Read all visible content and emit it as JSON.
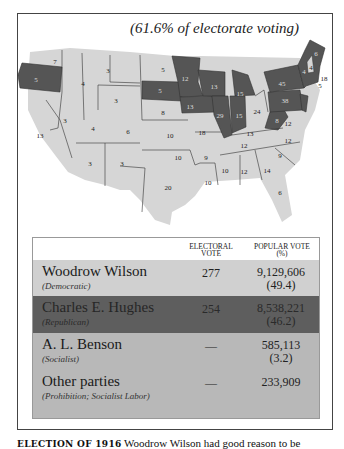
{
  "figure": {
    "subtitle": "(61.6% of electorate voting)",
    "colors": {
      "democratic": "#d6d6d6",
      "republican": "#555555",
      "state_border": "#333333",
      "table_header": "#ffffff",
      "wilson_row": "#d0d0d0",
      "hughes_row": "#5e5e5e",
      "other_rows": "#b8b8b8"
    }
  },
  "map": {
    "states": [
      {
        "abbr": "WA",
        "ev": "7",
        "party": "D"
      },
      {
        "abbr": "OR",
        "ev": "5",
        "party": "R"
      },
      {
        "abbr": "CA",
        "ev": "13",
        "party": "D"
      },
      {
        "abbr": "ID",
        "ev": "4",
        "party": "D"
      },
      {
        "abbr": "NV",
        "ev": "3",
        "party": "D"
      },
      {
        "abbr": "MT",
        "ev": "4",
        "party": "D"
      },
      {
        "abbr": "WY",
        "ev": "3",
        "party": "D"
      },
      {
        "abbr": "UT",
        "ev": "4",
        "party": "D"
      },
      {
        "abbr": "CO",
        "ev": "6",
        "party": "D"
      },
      {
        "abbr": "AZ",
        "ev": "3",
        "party": "D"
      },
      {
        "abbr": "NM",
        "ev": "3",
        "party": "D"
      },
      {
        "abbr": "ND",
        "ev": "5",
        "party": "D"
      },
      {
        "abbr": "SD",
        "ev": "5",
        "party": "R"
      },
      {
        "abbr": "NE",
        "ev": "8",
        "party": "D"
      },
      {
        "abbr": "KS",
        "ev": "10",
        "party": "D"
      },
      {
        "abbr": "OK",
        "ev": "10",
        "party": "D"
      },
      {
        "abbr": "TX",
        "ev": "20",
        "party": "D"
      },
      {
        "abbr": "MN",
        "ev": "12",
        "party": "R"
      },
      {
        "abbr": "IA",
        "ev": "13",
        "party": "R"
      },
      {
        "abbr": "MO",
        "ev": "18",
        "party": "D"
      },
      {
        "abbr": "AR",
        "ev": "9",
        "party": "D"
      },
      {
        "abbr": "LA",
        "ev": "10",
        "party": "D"
      },
      {
        "abbr": "WI",
        "ev": "13",
        "party": "R"
      },
      {
        "abbr": "IL",
        "ev": "29",
        "party": "R"
      },
      {
        "abbr": "MI",
        "ev": "15",
        "party": "R"
      },
      {
        "abbr": "IN",
        "ev": "15",
        "party": "R"
      },
      {
        "abbr": "OH",
        "ev": "24",
        "party": "D"
      },
      {
        "abbr": "KY",
        "ev": "13",
        "party": "D"
      },
      {
        "abbr": "TN",
        "ev": "12",
        "party": "D"
      },
      {
        "abbr": "MS",
        "ev": "10",
        "party": "D"
      },
      {
        "abbr": "AL",
        "ev": "12",
        "party": "D"
      },
      {
        "abbr": "GA",
        "ev": "14",
        "party": "D"
      },
      {
        "abbr": "FL",
        "ev": "6",
        "party": "D"
      },
      {
        "abbr": "SC",
        "ev": "9",
        "party": "D"
      },
      {
        "abbr": "NC",
        "ev": "12",
        "party": "D"
      },
      {
        "abbr": "VA",
        "ev": "12",
        "party": "D"
      },
      {
        "abbr": "WV",
        "ev": "8",
        "party": "R"
      },
      {
        "abbr": "PA",
        "ev": "38",
        "party": "R"
      },
      {
        "abbr": "NY",
        "ev": "45",
        "party": "R"
      },
      {
        "abbr": "VT",
        "ev": "4",
        "party": "R"
      },
      {
        "abbr": "NH",
        "ev": "4",
        "party": "D"
      },
      {
        "abbr": "ME",
        "ev": "6",
        "party": "R"
      },
      {
        "abbr": "MA",
        "ev": "18",
        "party": "R"
      },
      {
        "abbr": "RI",
        "ev": "5",
        "party": "R"
      },
      {
        "abbr": "CT",
        "ev": "7",
        "party": "R"
      },
      {
        "abbr": "NJ",
        "ev": "14",
        "party": "R"
      },
      {
        "abbr": "DE",
        "ev": "3",
        "party": "R"
      },
      {
        "abbr": "MD",
        "ev": "8",
        "party": "D"
      }
    ]
  },
  "table": {
    "headers": {
      "electoral_line1": "ELECTORAL",
      "electoral_line2": "VOTE",
      "popular_line1": "POPULAR VOTE",
      "popular_line2": "(%)"
    },
    "rows": [
      {
        "candidate": "Woodrow Wilson",
        "party": "(Democratic)",
        "electoral": "277",
        "popular": "9,129,606",
        "percent": "(49.4)"
      },
      {
        "candidate": "Charles E. Hughes",
        "party": "(Republican)",
        "electoral": "254",
        "popular": "8,538,221",
        "percent": "(46.2)"
      },
      {
        "candidate": "A. L. Benson",
        "party": "(Socialist)",
        "electoral": "—",
        "popular": "585,113",
        "percent": "(3.2)"
      },
      {
        "candidate": "Other parties",
        "party": "(Prohibition; Socialist Labor)",
        "electoral": "—",
        "popular": "233,909",
        "percent": ""
      }
    ]
  },
  "caption": {
    "label": "ELECTION OF 1916",
    "text": "Woodrow Wilson had good reason to be"
  }
}
